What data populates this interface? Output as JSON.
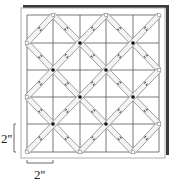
{
  "diagram": {
    "type": "quilting-grid",
    "grid": {
      "columns": 5,
      "rows": 5,
      "x_lines": [
        27,
        53,
        80,
        106,
        133,
        159
      ],
      "y_lines": [
        15,
        43,
        70,
        97,
        124,
        152
      ]
    },
    "colors": {
      "board": "#ffffff",
      "board_border": "#b0b0b0",
      "shadow": "#3a3a3a",
      "grid_line": "#555555",
      "strip_line": "#777777",
      "strip_fill": "#f4f4f4",
      "dot": "#111111",
      "arrow": "#555555"
    },
    "strips": [
      {
        "from": [
          53,
          15
        ],
        "to": [
          159,
          124
        ]
      },
      {
        "from": [
          106,
          15
        ],
        "to": [
          159,
          70
        ]
      },
      {
        "from": [
          27,
          43
        ],
        "to": [
          133,
          152
        ]
      },
      {
        "from": [
          27,
          97
        ],
        "to": [
          80,
          152
        ]
      },
      {
        "from": [
          27,
          152
        ],
        "to": [
          159,
          15
        ]
      },
      {
        "from": [
          27,
          97
        ],
        "to": [
          106,
          15
        ]
      },
      {
        "from": [
          80,
          152
        ],
        "to": [
          159,
          70
        ]
      },
      {
        "from": [
          27,
          43
        ],
        "to": [
          53,
          15
        ]
      },
      {
        "from": [
          133,
          152
        ],
        "to": [
          159,
          124
        ]
      }
    ],
    "intersection_dots": [
      [
        80,
        43
      ],
      [
        133,
        43
      ],
      [
        53,
        70
      ],
      [
        106,
        70
      ],
      [
        80,
        97
      ],
      [
        133,
        97
      ],
      [
        53,
        124
      ],
      [
        106,
        124
      ]
    ],
    "edge_vertices": [
      [
        53,
        15
      ],
      [
        106,
        15
      ],
      [
        159,
        15
      ],
      [
        27,
        43
      ],
      [
        27,
        97
      ],
      [
        27,
        152
      ],
      [
        159,
        70
      ],
      [
        159,
        124
      ],
      [
        80,
        152
      ],
      [
        133,
        152
      ]
    ],
    "dimensions": {
      "vertical": {
        "label": "2''"
      },
      "horizontal": {
        "label": "2''"
      }
    }
  }
}
